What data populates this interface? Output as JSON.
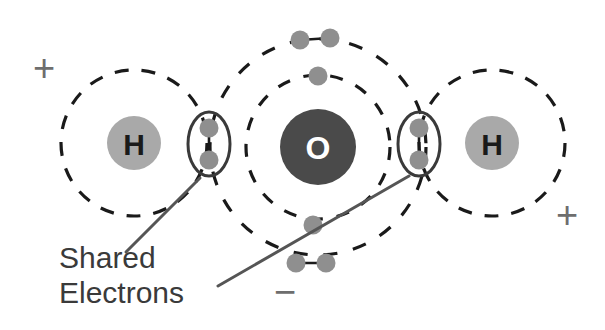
{
  "diagram": {
    "background_color": "#ffffff",
    "atoms": [
      {
        "id": "hydrogen-left",
        "label": "H",
        "element": "hydrogen",
        "cx": 134,
        "cy": 143,
        "r": 27,
        "fill": "#a9a9a9",
        "text_color": "#1a1a1a",
        "font_size": 30
      },
      {
        "id": "oxygen-center",
        "label": "O",
        "element": "oxygen",
        "cx": 318,
        "cy": 147,
        "r": 38,
        "fill": "#4a4a4a",
        "text_color": "#ffffff",
        "font_size": 32
      },
      {
        "id": "hydrogen-right",
        "label": "H",
        "element": "hydrogen",
        "cx": 492,
        "cy": 143,
        "r": 27,
        "fill": "#a9a9a9",
        "text_color": "#1a1a1a",
        "font_size": 30
      }
    ],
    "orbitals": [
      {
        "id": "orbital-h-left",
        "atom": "hydrogen-left",
        "cx": 134,
        "cy": 143,
        "rx": 73,
        "ry": 73,
        "stroke": "#1a1a1a",
        "stroke_width": 3.2,
        "dash": "14 13"
      },
      {
        "id": "orbital-o-inner",
        "atom": "oxygen-center",
        "cx": 318,
        "cy": 147,
        "rx": 72,
        "ry": 72,
        "stroke": "#1a1a1a",
        "stroke_width": 3.2,
        "dash": "13 14"
      },
      {
        "id": "orbital-o-outer",
        "atom": "oxygen-center",
        "cx": 318,
        "cy": 147,
        "rx": 108,
        "ry": 108,
        "stroke": "#1a1a1a",
        "stroke_width": 3.2,
        "dash": "14 16"
      },
      {
        "id": "orbital-h-right",
        "atom": "hydrogen-right",
        "cx": 492,
        "cy": 143,
        "rx": 73,
        "ry": 73,
        "stroke": "#1a1a1a",
        "stroke_width": 3.2,
        "dash": "14 13"
      }
    ],
    "electrons": [
      {
        "id": "electron-shared-left-upper",
        "group": "shared-pair-left",
        "cx": 209,
        "cy": 128,
        "r": 9.5,
        "fill": "#8f8f8f"
      },
      {
        "id": "electron-shared-left-lower",
        "group": "shared-pair-left",
        "cx": 209,
        "cy": 160,
        "r": 9.5,
        "fill": "#8f8f8f"
      },
      {
        "id": "electron-shared-right-upper",
        "group": "shared-pair-right",
        "cx": 419,
        "cy": 128,
        "r": 9.5,
        "fill": "#8f8f8f"
      },
      {
        "id": "electron-shared-right-lower",
        "group": "shared-pair-right",
        "cx": 419,
        "cy": 160,
        "r": 9.5,
        "fill": "#8f8f8f"
      },
      {
        "id": "electron-lone-top-left",
        "group": "lone-pair-top",
        "cx": 300,
        "cy": 40,
        "r": 9.5,
        "fill": "#8f8f8f"
      },
      {
        "id": "electron-lone-top-right",
        "group": "lone-pair-top",
        "cx": 330,
        "cy": 38,
        "r": 9.5,
        "fill": "#8f8f8f"
      },
      {
        "id": "electron-inner-top",
        "group": "inner-shell-top",
        "cx": 318,
        "cy": 76,
        "r": 9.5,
        "fill": "#8f8f8f"
      },
      {
        "id": "electron-inner-bottom",
        "group": "inner-shell-bottom",
        "cx": 313,
        "cy": 225,
        "r": 9.5,
        "fill": "#8f8f8f"
      },
      {
        "id": "electron-lone-bottom-left",
        "group": "lone-pair-bottom",
        "cx": 296,
        "cy": 263,
        "r": 9.5,
        "fill": "#8f8f8f"
      },
      {
        "id": "electron-lone-bottom-right",
        "group": "lone-pair-bottom",
        "cx": 326,
        "cy": 263,
        "r": 9.5,
        "fill": "#8f8f8f"
      }
    ],
    "bond_links": [
      {
        "id": "bond-shared-left",
        "x1": 209,
        "y1": 128,
        "x2": 209,
        "y2": 160,
        "stroke": "#1a1a1a",
        "stroke_width": 2.6
      },
      {
        "id": "bond-shared-right",
        "x1": 419,
        "y1": 128,
        "x2": 419,
        "y2": 160,
        "stroke": "#1a1a1a",
        "stroke_width": 2.6
      },
      {
        "id": "bond-lone-top",
        "x1": 300,
        "y1": 40,
        "x2": 330,
        "y2": 38,
        "stroke": "#1a1a1a",
        "stroke_width": 2.6
      },
      {
        "id": "bond-lone-bottom",
        "x1": 296,
        "y1": 263,
        "x2": 326,
        "y2": 263,
        "stroke": "#1a1a1a",
        "stroke_width": 2.6
      }
    ],
    "bond_ellipses": [
      {
        "id": "shared-pair-ellipse-left",
        "cx": 209,
        "cy": 144,
        "rx": 21,
        "ry": 32,
        "stroke": "#3a3a3a",
        "stroke_width": 3
      },
      {
        "id": "shared-pair-ellipse-right",
        "cx": 419,
        "cy": 144,
        "rx": 21,
        "ry": 32,
        "stroke": "#3a3a3a",
        "stroke_width": 3
      }
    ],
    "leader_lines": [
      {
        "id": "leader-line-left",
        "x1": 200,
        "y1": 178,
        "x2": 126,
        "y2": 252,
        "stroke": "#555555",
        "stroke_width": 3
      },
      {
        "id": "leader-line-right",
        "x1": 409,
        "y1": 176,
        "x2": 218,
        "y2": 286,
        "stroke": "#555555",
        "stroke_width": 3
      }
    ],
    "charges": [
      {
        "id": "charge-positive-left",
        "symbol": "+",
        "x": 44,
        "y": 68,
        "font_size": 38,
        "color": "#6e6e6e"
      },
      {
        "id": "charge-positive-right",
        "symbol": "+",
        "x": 567,
        "y": 215,
        "font_size": 38,
        "color": "#6e6e6e"
      },
      {
        "id": "charge-negative",
        "symbol": "−",
        "x": 285,
        "y": 292,
        "font_size": 38,
        "color": "#6e6e6e"
      }
    ],
    "caption": {
      "id": "shared-electrons-caption",
      "line1": "Shared",
      "line2": "Electrons",
      "x": 59,
      "y1": 268,
      "y2": 303,
      "color": "#3a3a3a",
      "font_size": 30
    }
  }
}
